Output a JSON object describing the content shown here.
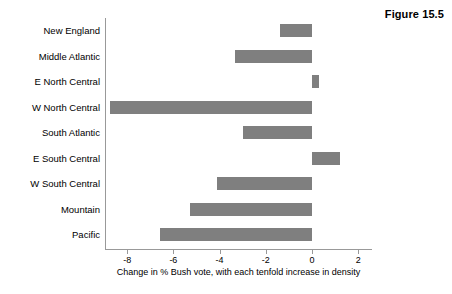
{
  "figure": {
    "label": "Figure 15.5"
  },
  "chart_data": {
    "type": "bar",
    "orientation": "horizontal",
    "title": "",
    "subtitle": "",
    "xlabel": "Change in % Bush vote, with each tenfold increase in density",
    "ylabel": "",
    "categories": [
      "New England",
      "Middle Atlantic",
      "E North Central",
      "W North Central",
      "South Atlantic",
      "E South Central",
      "W South Central",
      "Mountain",
      "Pacific"
    ],
    "values": [
      -1.4,
      -3.35,
      0.3,
      -8.75,
      -3.0,
      1.2,
      -4.1,
      -5.3,
      -6.6
    ],
    "xlim": [
      -9.0,
      2.6
    ],
    "xticks": [
      -8,
      -6,
      -4,
      -2,
      0,
      2
    ],
    "xticklabels": [
      "-8",
      "-6",
      "-4",
      "-2",
      "0",
      "2"
    ],
    "grid": false,
    "legend": null,
    "bar_color": "#7f7f7f",
    "axis_color": "#999999",
    "background": "#ffffff"
  }
}
